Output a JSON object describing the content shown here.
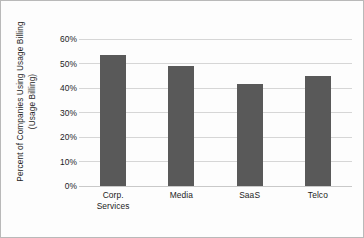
{
  "chart_data": {
    "type": "bar",
    "title": "",
    "subtitle": "",
    "xlabel": "",
    "ylabel": "Percent of Companies Using Usage Billing (Usage Billing)",
    "ylabel_lines": [
      "Percent of Companies Using Usage Billing",
      "(Usage Billing)"
    ],
    "categories": [
      "Corp. Services",
      "Media",
      "SaaS",
      "Telco"
    ],
    "category_lines": [
      [
        "Corp.",
        "Services"
      ],
      [
        "Media"
      ],
      [
        "SaaS"
      ],
      [
        "Telco"
      ]
    ],
    "values": [
      53.5,
      49.0,
      41.5,
      45.0
    ],
    "ylim": [
      0,
      60
    ],
    "yticks": [
      0,
      10,
      20,
      30,
      40,
      50,
      60
    ],
    "ytick_labels": [
      "0%",
      "10%",
      "20%",
      "30%",
      "40%",
      "50%",
      "60%"
    ],
    "grid": "horizontal",
    "legend": "none",
    "bar_color": "#595959",
    "gridline_color": "#d6d6d6",
    "background_color": "#fdfdfd",
    "border_color": "#b9b9b9",
    "text_color": "#1c1c1c"
  }
}
